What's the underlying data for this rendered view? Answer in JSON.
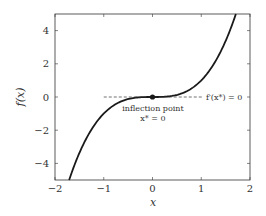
{
  "chart_data": {
    "type": "line",
    "title": "",
    "xlabel": "x",
    "ylabel": "f(x)",
    "xlim": [
      -2,
      2
    ],
    "ylim": [
      -5,
      5
    ],
    "grid": false,
    "legend": null,
    "xticks": [
      -2,
      -1,
      0,
      1,
      2
    ],
    "xtick_labels": [
      "−2",
      "−1",
      "0",
      "1",
      "2"
    ],
    "yticks": [
      -4,
      -2,
      0,
      2,
      4
    ],
    "ytick_labels": [
      "−4",
      "−2",
      "0",
      "2",
      "4"
    ],
    "series": [
      {
        "name": "f(x) = x^3",
        "style": "solid",
        "color": "#1a1a1a",
        "x": [
          -1.71,
          -1.5,
          -1.25,
          -1.0,
          -0.75,
          -0.5,
          -0.25,
          0,
          0.25,
          0.5,
          0.75,
          1.0,
          1.25,
          1.5,
          1.71
        ],
        "y": [
          -5.0,
          -3.375,
          -1.953,
          -1.0,
          -0.422,
          -0.125,
          -0.016,
          0,
          0.016,
          0.125,
          0.422,
          1.0,
          1.953,
          3.375,
          5.0
        ]
      },
      {
        "name": "tangent f'(x*) = 0",
        "style": "dashed",
        "color": "#333333",
        "x": [
          -1.0,
          1.02
        ],
        "y": [
          0,
          0
        ]
      }
    ],
    "points": [
      {
        "name": "inflection point",
        "x": 0,
        "y": 0,
        "color": "#1a1a1a"
      }
    ],
    "annotations": [
      {
        "text": "f′(x*) = 0",
        "x": 1.05,
        "y": 0
      },
      {
        "text": "inflection point",
        "x": 0,
        "y": -0.55
      },
      {
        "text": "x* = 0",
        "x": 0,
        "y": -1.0
      }
    ]
  },
  "labels": {
    "xlabel": "x",
    "ylabel": "f(x)",
    "tangent": "f′(x*) = 0",
    "inflection_line1": "inflection point",
    "inflection_line2": "x* = 0"
  },
  "colors": {
    "curve": "#1a1a1a",
    "axes": "#333333",
    "text": "#333333"
  }
}
